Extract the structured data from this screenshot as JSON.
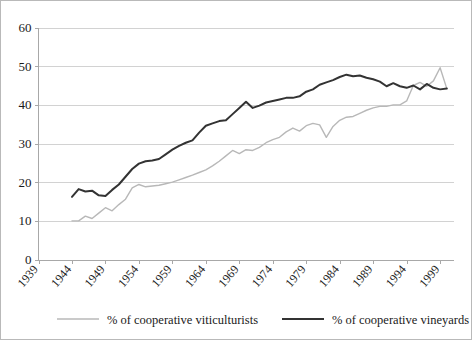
{
  "chart_data": {
    "type": "line",
    "title": "",
    "subtitle": "",
    "xlabel": "",
    "ylabel": "",
    "xlim": [
      1939,
      2001
    ],
    "ylim": [
      0,
      60
    ],
    "ytick_labels": [
      "0",
      "10",
      "20",
      "30",
      "40",
      "50",
      "60"
    ],
    "yticks": [
      0,
      10,
      20,
      30,
      40,
      50,
      60
    ],
    "xtick_labels": [
      "1939",
      "1944",
      "1949",
      "1954",
      "1959",
      "1964",
      "1969",
      "1974",
      "1979",
      "1984",
      "1989",
      "1994",
      "1999"
    ],
    "xticks": [
      1939,
      1944,
      1949,
      1954,
      1959,
      1964,
      1969,
      1974,
      1979,
      1984,
      1989,
      1994,
      1999
    ],
    "grid": "horizontal",
    "legend_position": "bottom",
    "x": [
      1944,
      1945,
      1946,
      1947,
      1948,
      1949,
      1950,
      1951,
      1952,
      1953,
      1954,
      1955,
      1956,
      1957,
      1958,
      1959,
      1960,
      1961,
      1962,
      1963,
      1964,
      1965,
      1966,
      1967,
      1968,
      1969,
      1970,
      1971,
      1972,
      1973,
      1974,
      1975,
      1976,
      1977,
      1978,
      1979,
      1980,
      1981,
      1982,
      1983,
      1984,
      1985,
      1986,
      1987,
      1988,
      1989,
      1990,
      1991,
      1992,
      1993,
      1994,
      1995,
      1996,
      1997,
      1998,
      1999,
      2000
    ],
    "series": [
      {
        "name": "% of cooperative viticulturists",
        "color": "#b8b8b8",
        "width": 1.4,
        "values": [
          10.0,
          10.0,
          11.2,
          10.6,
          12.0,
          13.4,
          12.6,
          14.2,
          15.6,
          18.5,
          19.4,
          18.8,
          19.0,
          19.2,
          19.6,
          20.0,
          20.6,
          21.2,
          21.8,
          22.5,
          23.2,
          24.2,
          25.4,
          26.8,
          28.2,
          27.4,
          28.4,
          28.2,
          29.0,
          30.2,
          31.0,
          31.6,
          33.0,
          34.0,
          33.2,
          34.6,
          35.2,
          34.8,
          31.6,
          34.4,
          36.0,
          36.8,
          37.0,
          37.8,
          38.6,
          39.2,
          39.6,
          39.6,
          40.0,
          40.0,
          41.0,
          45.0,
          45.8,
          44.8,
          46.2,
          49.6,
          44.2
        ]
      },
      {
        "name": "% of cooperative vineyards",
        "color": "#333333",
        "width": 2.0,
        "values": [
          16.2,
          18.2,
          17.6,
          17.8,
          16.6,
          16.4,
          18.0,
          19.4,
          21.4,
          23.4,
          24.8,
          25.4,
          25.6,
          26.0,
          27.2,
          28.4,
          29.4,
          30.2,
          30.8,
          32.8,
          34.6,
          35.2,
          35.8,
          36.0,
          37.6,
          39.2,
          40.8,
          39.2,
          39.8,
          40.6,
          41.0,
          41.4,
          41.8,
          41.8,
          42.2,
          43.4,
          44.0,
          45.2,
          45.8,
          46.4,
          47.2,
          47.8,
          47.4,
          47.6,
          47.0,
          46.6,
          46.0,
          44.8,
          45.6,
          44.8,
          44.4,
          45.0,
          44.0,
          45.4,
          44.4,
          44.0,
          44.2
        ]
      }
    ],
    "legend": [
      {
        "label": "% of cooperative viticulturists",
        "color": "#b8b8b8",
        "width": 1.4
      },
      {
        "label": "% of cooperative vineyards",
        "color": "#333333",
        "width": 2.0
      }
    ]
  }
}
